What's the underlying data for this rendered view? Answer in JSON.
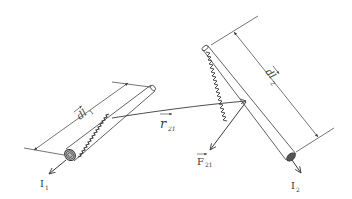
{
  "diagram": {
    "type": "physics-illustration",
    "colors": {
      "background": "#ffffff",
      "ink": "#3a3a3a"
    },
    "wire1": {
      "length_label": "dl",
      "length_label_sub": "1",
      "current_label": "I",
      "current_label_sub": "1"
    },
    "wire2": {
      "length_label": "dl",
      "length_label_sub": "2",
      "current_label": "I",
      "current_label_sub": "2"
    },
    "displacement": {
      "label": "r",
      "label_sub": "21"
    },
    "force": {
      "label": "F",
      "label_sub": "21"
    }
  }
}
